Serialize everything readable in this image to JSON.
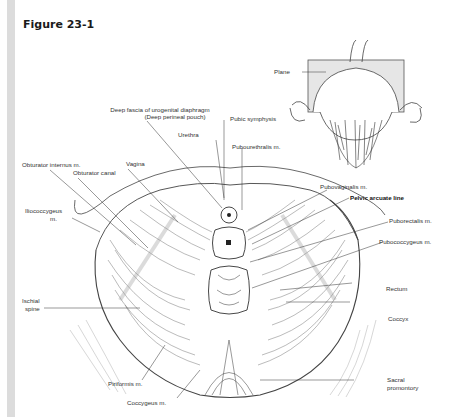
{
  "figure": {
    "title": "Figure 23-1"
  },
  "inset": {
    "labels": {
      "plane": "Plane"
    }
  },
  "labels": {
    "deep_fascia": "Deep fascia of urogenital diaphragm",
    "deep_perineal_pouch": "(Deep perineal pouch)",
    "pubic_symphysis": "Pubic symphysis",
    "urethra": "Urethra",
    "pubourethralis": "Pubourethralis m.",
    "obturator_internus": "Obturator internus m.",
    "obturator_canal": "Obturator canal",
    "vagina": "Vagina",
    "pubovaginalis": "Pubovaginalis m.",
    "pelvic_arcuate_line": "Pelvic arcuate line",
    "iliococcygeus_1": "Iliococcygeus",
    "iliococcygeus_2": "m.",
    "puborectalis": "Puborectalis m.",
    "pubococcygeus": "Pubococcygeus m.",
    "rectum": "Rectum",
    "ischial_spine_1": "Ischial",
    "ischial_spine_2": "spine",
    "coccyx": "Coccyx",
    "piriformis": "Piriformis m.",
    "coccygeus": "Coccygeus m.",
    "sacral_1": "Sacral",
    "sacral_2": "promontory"
  },
  "colors": {
    "background": "#ffffff",
    "left_bar": "#dcdcdc",
    "line": "#333333",
    "muscle": "#555555"
  }
}
